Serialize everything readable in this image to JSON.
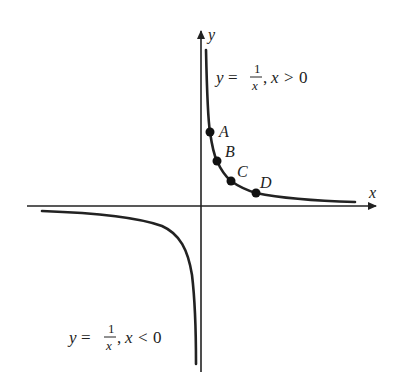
{
  "figure": {
    "axes": {
      "x_label": "x",
      "y_label": "y"
    },
    "curves": [
      {
        "name": "positive-branch",
        "equation_lhs": "y",
        "equation_eq": "=",
        "numerator": "1",
        "denominator": "x",
        "condition_var": "x",
        "condition_op": ">",
        "condition_val": "0"
      },
      {
        "name": "negative-branch",
        "equation_lhs": "y",
        "equation_eq": "=",
        "numerator": "1",
        "denominator": "x",
        "condition_var": "x",
        "condition_op": "<",
        "condition_val": "0"
      }
    ],
    "points": [
      {
        "label": "A"
      },
      {
        "label": "B"
      },
      {
        "label": "C"
      },
      {
        "label": "D"
      }
    ],
    "colors": {
      "ink": "#222222",
      "background": "#ffffff"
    }
  }
}
